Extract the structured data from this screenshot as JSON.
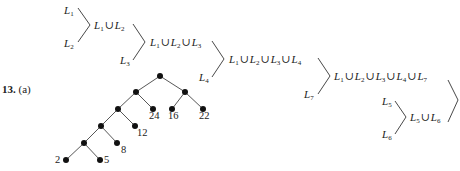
{
  "problem": {
    "number": "13.",
    "part": "(a)"
  },
  "merge_diagram": {
    "labels": [
      {
        "id": "L1",
        "text": "L1",
        "x": 64,
        "y": 5
      },
      {
        "id": "L2",
        "text": "L2",
        "x": 64,
        "y": 38
      },
      {
        "id": "L1uL2",
        "text": "L1 ∪ L2",
        "x": 94,
        "y": 21
      },
      {
        "id": "L3",
        "text": "L3",
        "x": 120,
        "y": 55
      },
      {
        "id": "L1uL2uL3",
        "text": "L1 ∪ L2 ∪ L3",
        "x": 150,
        "y": 38
      },
      {
        "id": "L4",
        "text": "L4",
        "x": 199,
        "y": 72
      },
      {
        "id": "L1..L4",
        "text": "L1 ∪ L2 ∪ L3 ∪ L4",
        "x": 229,
        "y": 55
      },
      {
        "id": "L7",
        "text": "L7",
        "x": 304,
        "y": 89
      },
      {
        "id": "L1..L7",
        "text": "L1 ∪ L2 ∪ L3 ∪ L4 ∪ L7",
        "x": 334,
        "y": 72
      },
      {
        "id": "L5",
        "text": "L5",
        "x": 382,
        "y": 97
      },
      {
        "id": "L6",
        "text": "L6",
        "x": 382,
        "y": 130
      },
      {
        "id": "L5uL6",
        "text": "L5 ∪ L6",
        "x": 410,
        "y": 113
      }
    ]
  },
  "tree": {
    "node_labels": [
      "2",
      "5",
      "8",
      "12",
      "24",
      "16",
      "22"
    ]
  }
}
